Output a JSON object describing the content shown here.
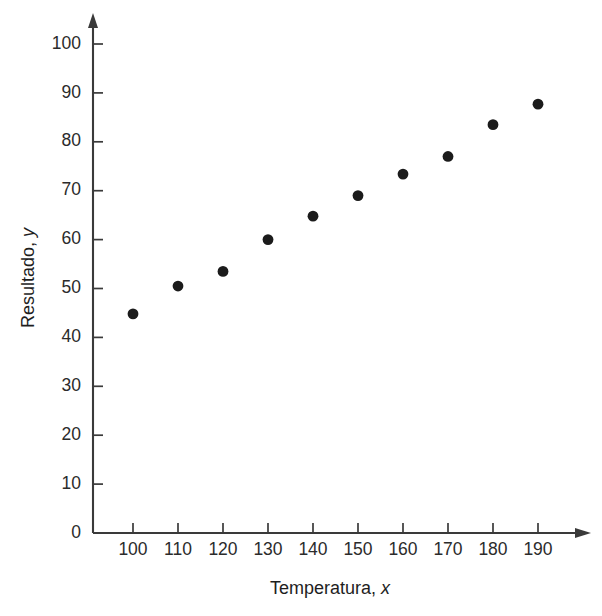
{
  "chart_data": {
    "type": "scatter",
    "title": "",
    "xlabel": "Temperatura, x",
    "xlabel_main": "Temperatura, ",
    "xlabel_italic": "x",
    "ylabel": "Resultado, y",
    "ylabel_main": "Resultado, ",
    "ylabel_italic": "y",
    "x": [
      100,
      110,
      120,
      130,
      140,
      150,
      160,
      170,
      180,
      190
    ],
    "values": [
      44.8,
      50.5,
      53.5,
      60.0,
      64.8,
      69.0,
      73.4,
      77.0,
      83.5,
      87.7
    ],
    "points": [
      {
        "x": 100,
        "y": 44.8
      },
      {
        "x": 110,
        "y": 50.5
      },
      {
        "x": 120,
        "y": 53.5
      },
      {
        "x": 130,
        "y": 60.0
      },
      {
        "x": 140,
        "y": 64.8
      },
      {
        "x": 150,
        "y": 69.0
      },
      {
        "x": 160,
        "y": 73.4
      },
      {
        "x": 170,
        "y": 77.0
      },
      {
        "x": 180,
        "y": 83.5
      },
      {
        "x": 190,
        "y": 87.7
      }
    ],
    "xticks": [
      100,
      110,
      120,
      130,
      140,
      150,
      160,
      170,
      180,
      190
    ],
    "xtick_labels": [
      "100",
      "110",
      "120",
      "130",
      "140",
      "150",
      "160",
      "170",
      "180",
      "190"
    ],
    "yticks": [
      0,
      10,
      20,
      30,
      40,
      50,
      60,
      70,
      80,
      90,
      100
    ],
    "ytick_labels": [
      "0",
      "10",
      "20",
      "30",
      "40",
      "50",
      "60",
      "70",
      "80",
      "90",
      "100"
    ],
    "xlim": [
      93.0,
      201.0
    ],
    "ylim": [
      0,
      106
    ],
    "grid": false,
    "legend": null,
    "marker_color": "#1b1b1b",
    "axis_color": "#3a3a3a",
    "background": "#ffffff",
    "marker_radius_px": 5.4,
    "axis_arrows": [
      "x-right",
      "y-up"
    ]
  },
  "caption": {
    "partial_text": ""
  }
}
